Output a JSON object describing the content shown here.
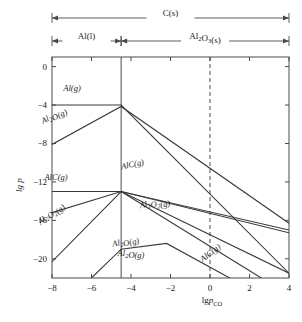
{
  "chart_data": {
    "type": "line",
    "title": "",
    "xlabel": "lg p_CO",
    "ylabel": "lg p",
    "xlim": [
      -8,
      4
    ],
    "ylim": [
      -22,
      1
    ],
    "xticks": [
      -8,
      -6,
      -4,
      -2,
      0,
      2,
      4
    ],
    "xticklabels": [
      "−8",
      "−6",
      "−4",
      "−2",
      "0",
      "2",
      "4"
    ],
    "yticks": [
      0,
      -4,
      -8,
      -12,
      -16,
      -20
    ],
    "yticklabels": [
      "0",
      "−4",
      "−8",
      "−12",
      "−16",
      "−20"
    ],
    "grid": false,
    "legend": "none",
    "vertical_lines": [
      {
        "name": "phase-boundary-solid",
        "x": -4.5,
        "style": "solid"
      },
      {
        "name": "reference-dashed",
        "x": 0.0,
        "style": "dashed"
      }
    ],
    "phase_spans": [
      {
        "label": "C(s)",
        "from": -8,
        "to": 4,
        "row": 0
      },
      {
        "label": "Al(l)",
        "from": -8,
        "to": -4.5,
        "row": 1
      },
      {
        "label": "Al₂O₃(s)",
        "from": -4.5,
        "to": 4,
        "row": 1
      }
    ],
    "series": [
      {
        "name": "Al(g)",
        "label": "Al(g)",
        "points": [
          [
            -8,
            -4.0
          ],
          [
            -4.5,
            -4.0
          ],
          [
            4,
            -21.5
          ]
        ]
      },
      {
        "name": "Al2O(g)-upper",
        "label": "Al₂O(g)",
        "points": [
          [
            -8,
            -8.1
          ],
          [
            -4.5,
            -4.15
          ],
          [
            4,
            -16.3
          ]
        ]
      },
      {
        "name": "AlC(g)-upper",
        "label": "AlC(g)",
        "points": [
          [
            -8,
            -13.0
          ],
          [
            -4.5,
            -13.0
          ],
          [
            4,
            -21.5
          ]
        ]
      },
      {
        "name": "AlC(g)-lower",
        "label": "AlC(g)",
        "points": [
          [
            -8,
            -15.2
          ],
          [
            -4.5,
            -13.0
          ],
          [
            4,
            -17.3
          ]
        ]
      },
      {
        "name": "Al2O2(g)",
        "label": "Al₂O₂(g)",
        "points": [
          [
            -8,
            -20.3
          ],
          [
            -4.5,
            -13.0
          ],
          [
            4,
            -17.0
          ]
        ]
      },
      {
        "name": "Al2O(g)-lower",
        "label": "Al₂O(g)",
        "points": [
          [
            -6.0,
            -22.0
          ],
          [
            -4.5,
            -19.0
          ],
          [
            -2.2,
            -18.4
          ],
          [
            1.0,
            -22.0
          ]
        ]
      },
      {
        "name": "AlC(g)-descending",
        "label": "AlC(g)",
        "points": [
          [
            -4.5,
            -13.0
          ],
          [
            2.6,
            -22.0
          ]
        ]
      }
    ],
    "curve_labels": [
      {
        "text": "Al(g)",
        "x": 72,
        "y": 91,
        "rotate": 0
      },
      {
        "text": "Al₂O(g)",
        "x": 55,
        "y": 118,
        "rotate": -26
      },
      {
        "text": "AlC(g)",
        "x": 56,
        "y": 180,
        "rotate": 0
      },
      {
        "text": "AlC(g)",
        "x": 133,
        "y": 167,
        "rotate": -12
      },
      {
        "text": "Al₂O₂(g)",
        "x": 52,
        "y": 215,
        "rotate": -42
      },
      {
        "text": "Al₂O₂(g)",
        "x": 155,
        "y": 205,
        "rotate": -12
      },
      {
        "text": "Al₂O(g)",
        "x": 126,
        "y": 244,
        "rotate": -12
      },
      {
        "text": "Al₂O(g)",
        "x": 131,
        "y": 256,
        "rotate": 0
      },
      {
        "text": "AlC(g)",
        "x": 212,
        "y": 255,
        "rotate": -38
      }
    ],
    "colors": {
      "axis": "#4a4a4a",
      "curve": "#3a3a3a",
      "text": "#1a1a1a",
      "background": "#ffffff"
    }
  }
}
